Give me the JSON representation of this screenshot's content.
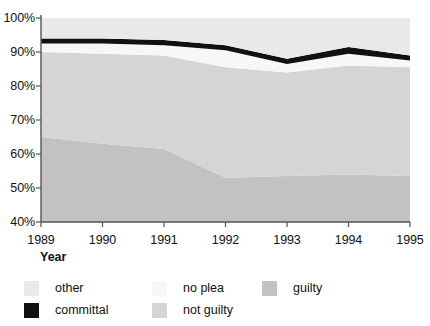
{
  "chart_data": {
    "type": "area",
    "stacked": true,
    "title": "",
    "subtitle": "",
    "xlabel": "Year",
    "ylabel": "",
    "x": [
      1989,
      1990,
      1991,
      1992,
      1993,
      1994,
      1995
    ],
    "categories": [
      "1989",
      "1990",
      "1991",
      "1992",
      "1993",
      "1994",
      "1995"
    ],
    "xlim": [
      1989,
      1995
    ],
    "ylim": [
      40,
      100
    ],
    "y_tick_values": [
      40,
      50,
      60,
      70,
      80,
      90,
      100
    ],
    "y_tick_labels": [
      "40%",
      "50%",
      "60%",
      "70%",
      "80%",
      "90%",
      "100%"
    ],
    "x_tick_labels": [
      "1989",
      "1990",
      "1991",
      "1992",
      "1993",
      "1994",
      "1995"
    ],
    "grid": false,
    "legend_position": "bottom",
    "units": "percent",
    "stack_order_bottom_to_top": [
      "guilty",
      "not guilty",
      "no plea",
      "committal",
      "other"
    ],
    "series": [
      {
        "name": "guilty",
        "color": "#c2c2c2",
        "values": [
          65.0,
          63.0,
          61.5,
          53.0,
          53.5,
          54.0,
          53.5
        ],
        "cumulative_top": [
          65.0,
          63.0,
          61.5,
          53.0,
          53.5,
          54.0,
          53.5
        ]
      },
      {
        "name": "not guilty",
        "color": "#d5d5d5",
        "values": [
          25.0,
          26.5,
          27.5,
          32.5,
          30.5,
          32.0,
          32.0
        ],
        "cumulative_top": [
          90.0,
          89.5,
          89.0,
          85.5,
          84.0,
          86.0,
          85.5
        ]
      },
      {
        "name": "no plea",
        "color": "#f7f7f7",
        "values": [
          2.5,
          3.0,
          3.0,
          5.0,
          2.5,
          3.5,
          2.0
        ],
        "cumulative_top": [
          92.5,
          92.5,
          92.0,
          90.5,
          86.5,
          89.5,
          87.5
        ]
      },
      {
        "name": "committal",
        "color": "#111111",
        "values": [
          1.5,
          1.5,
          1.5,
          1.5,
          1.5,
          2.0,
          1.5
        ],
        "cumulative_top": [
          94.0,
          94.0,
          93.5,
          92.0,
          88.0,
          91.5,
          89.0
        ]
      },
      {
        "name": "other",
        "color": "#e9e9e9",
        "values": [
          6.0,
          6.0,
          6.5,
          8.0,
          12.0,
          8.5,
          11.0
        ],
        "cumulative_top": [
          100.0,
          100.0,
          100.0,
          100.0,
          100.0,
          100.0,
          100.0
        ]
      }
    ]
  },
  "axes": {
    "x_title": "Year",
    "y_ticks": [
      "100%",
      "90%",
      "80%",
      "70%",
      "60%",
      "50%",
      "40%"
    ],
    "x_ticks": [
      "1989",
      "1990",
      "1991",
      "1992",
      "1993",
      "1994",
      "1995"
    ]
  },
  "legend": {
    "row1": [
      {
        "label": "other",
        "color": "#e9e9e9"
      },
      {
        "label": "no plea",
        "color": "#f7f7f7"
      },
      {
        "label": "guilty",
        "color": "#c2c2c2"
      }
    ],
    "row2": [
      {
        "label": "committal",
        "color": "#111111"
      },
      {
        "label": "not guilty",
        "color": "#d5d5d5"
      }
    ]
  },
  "colors": {
    "axis": "#555555",
    "text": "#111111",
    "background": "#ffffff"
  }
}
